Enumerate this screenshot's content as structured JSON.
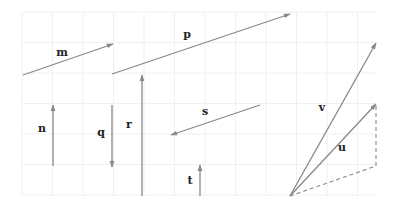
{
  "diagram": {
    "type": "vector-diagram",
    "canvas": {
      "width": 397,
      "height": 206,
      "background": "#ffffff"
    },
    "grid": {
      "x_start": 22,
      "x_end": 376,
      "y_start": 12,
      "y_end": 196,
      "spacing": 30.5,
      "color": "#f0f0f0"
    },
    "colors": {
      "vector": "#888888",
      "dashed": "#888888",
      "label": "#222222"
    },
    "vectors": [
      {
        "name": "m",
        "label": "m",
        "x1": 23,
        "y1": 75,
        "x2": 113,
        "y2": 44,
        "label_x": 62,
        "label_y": 56
      },
      {
        "name": "p",
        "label": "p",
        "x1": 112,
        "y1": 74,
        "x2": 290,
        "y2": 14,
        "label_x": 187,
        "label_y": 38
      },
      {
        "name": "n",
        "label": "n",
        "x1": 53,
        "y1": 166,
        "x2": 53,
        "y2": 105,
        "label_x": 42,
        "label_y": 132
      },
      {
        "name": "q",
        "label": "q",
        "x1": 112,
        "y1": 105,
        "x2": 112,
        "y2": 167,
        "label_x": 101,
        "label_y": 136
      },
      {
        "name": "r",
        "label": "r",
        "x1": 142,
        "y1": 196,
        "x2": 142,
        "y2": 75,
        "label_x": 129,
        "label_y": 128
      },
      {
        "name": "s",
        "label": "s",
        "x1": 260,
        "y1": 105,
        "x2": 171,
        "y2": 135,
        "label_x": 205,
        "label_y": 115
      },
      {
        "name": "t",
        "label": "t",
        "x1": 200,
        "y1": 196,
        "x2": 200,
        "y2": 165,
        "label_x": 190,
        "label_y": 184
      },
      {
        "name": "v",
        "label": "v",
        "x1": 290,
        "y1": 196,
        "x2": 376,
        "y2": 43,
        "label_x": 322,
        "label_y": 111
      },
      {
        "name": "u",
        "label": "u",
        "x1": 290,
        "y1": 196,
        "x2": 376,
        "y2": 104,
        "label_x": 342,
        "label_y": 151
      }
    ],
    "dashed_lines": [
      {
        "name": "parallelogram-bottom",
        "x1": 290,
        "y1": 196,
        "x2": 376,
        "y2": 166
      },
      {
        "name": "parallelogram-right",
        "x1": 376,
        "y1": 166,
        "x2": 376,
        "y2": 104
      }
    ]
  }
}
